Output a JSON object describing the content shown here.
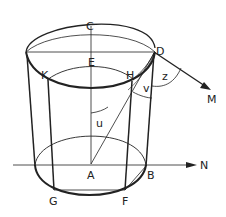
{
  "diagram": {
    "type": "geometric-figure",
    "points": {
      "C": {
        "label": "C"
      },
      "D": {
        "label": "D"
      },
      "E": {
        "label": "E"
      },
      "H": {
        "label": "H"
      },
      "K": {
        "label": "K"
      },
      "A": {
        "label": "A"
      },
      "B": {
        "label": "B"
      },
      "G": {
        "label": "G"
      },
      "F": {
        "label": "F"
      }
    },
    "angles": {
      "u": {
        "label": "u"
      },
      "v": {
        "label": "v"
      },
      "z": {
        "label": "z"
      }
    },
    "arrows": {
      "M": {
        "label": "M"
      },
      "N": {
        "label": "N"
      }
    },
    "colors": {
      "stroke": "#222222",
      "background": "#ffffff"
    }
  }
}
